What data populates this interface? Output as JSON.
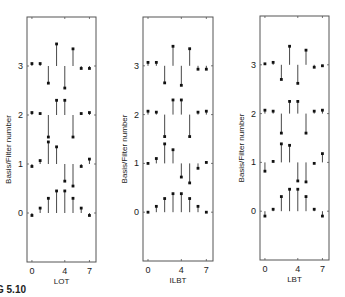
{
  "figure": {
    "caption": "G 5.10"
  },
  "chart_data": [
    {
      "type": "stem",
      "title": "",
      "xlabel": "LOT",
      "ylabel": "Basis/Filter number",
      "xticks": [
        0,
        4,
        7
      ],
      "yticks": [
        0,
        1,
        2,
        3
      ],
      "xlim": [
        -0.6,
        7.8
      ],
      "ylim": [
        -1,
        4
      ],
      "grid": false,
      "x": [
        0,
        1,
        2,
        3,
        4,
        5,
        6,
        7
      ],
      "series": [
        {
          "name": "basis 0",
          "offset": 0,
          "values": [
            -0.05,
            0.1,
            0.3,
            0.45,
            0.45,
            0.3,
            0.1,
            -0.05
          ]
        },
        {
          "name": "basis 1",
          "offset": 1,
          "values": [
            -0.05,
            0.07,
            0.45,
            0.35,
            -0.35,
            -0.45,
            -0.05,
            0.1
          ]
        },
        {
          "name": "basis 2",
          "offset": 2,
          "values": [
            0.05,
            0.03,
            -0.45,
            0.3,
            0.3,
            -0.45,
            0.03,
            0.05
          ]
        },
        {
          "name": "basis 3",
          "offset": 3,
          "values": [
            0.05,
            0.05,
            -0.35,
            0.45,
            -0.45,
            0.35,
            -0.05,
            -0.05
          ]
        }
      ]
    },
    {
      "type": "stem",
      "title": "",
      "xlabel": "ILBT",
      "ylabel": "Basis/Filter number",
      "xticks": [
        0,
        4,
        7
      ],
      "yticks": [
        0,
        1,
        2,
        3
      ],
      "xlim": [
        -0.6,
        7.8
      ],
      "ylim": [
        -1,
        4
      ],
      "grid": false,
      "x": [
        0,
        1,
        2,
        3,
        4,
        5,
        6,
        7
      ],
      "series": [
        {
          "name": "basis 0",
          "offset": 0,
          "values": [
            0.0,
            0.12,
            0.28,
            0.38,
            0.38,
            0.28,
            0.12,
            0.0
          ]
        },
        {
          "name": "basis 1",
          "offset": 1,
          "values": [
            0.0,
            0.1,
            0.4,
            0.28,
            -0.28,
            -0.4,
            -0.1,
            0.02
          ]
        },
        {
          "name": "basis 2",
          "offset": 2,
          "values": [
            0.07,
            0.05,
            -0.45,
            0.3,
            0.3,
            -0.45,
            0.05,
            0.07
          ]
        },
        {
          "name": "basis 3",
          "offset": 3,
          "values": [
            0.07,
            0.07,
            -0.35,
            0.4,
            -0.4,
            0.35,
            -0.07,
            -0.07
          ]
        }
      ]
    },
    {
      "type": "stem",
      "title": "",
      "xlabel": "LBT",
      "ylabel": "Basis/Filter number",
      "xticks": [
        0,
        4,
        7
      ],
      "yticks": [
        0,
        1,
        2,
        3
      ],
      "xlim": [
        -0.6,
        7.8
      ],
      "ylim": [
        -1,
        4
      ],
      "grid": false,
      "x": [
        0,
        1,
        2,
        3,
        4,
        5,
        6,
        7
      ],
      "series": [
        {
          "name": "basis 0",
          "offset": 0,
          "values": [
            -0.1,
            0.04,
            0.3,
            0.45,
            0.45,
            0.3,
            0.04,
            -0.1
          ]
        },
        {
          "name": "basis 1",
          "offset": 1,
          "values": [
            -0.18,
            0.02,
            0.38,
            0.35,
            -0.38,
            -0.4,
            -0.02,
            0.18
          ]
        },
        {
          "name": "basis 2",
          "offset": 2,
          "values": [
            0.07,
            0.05,
            -0.4,
            0.25,
            0.25,
            -0.4,
            0.05,
            0.07
          ]
        },
        {
          "name": "basis 3",
          "offset": 3,
          "values": [
            0.02,
            0.05,
            -0.3,
            0.38,
            -0.38,
            0.3,
            -0.05,
            -0.02
          ]
        }
      ]
    }
  ],
  "panels": [
    {
      "xlabel": "LOT",
      "ylabel": "Basis/Filter number",
      "xtick_labels": [
        "0",
        "4",
        "7"
      ],
      "ytick_labels": [
        "0",
        "1",
        "2",
        "3"
      ]
    },
    {
      "xlabel": "ILBT",
      "ylabel": "Basis/Filter number",
      "xtick_labels": [
        "0",
        "4",
        "7"
      ],
      "ytick_labels": [
        "0",
        "1",
        "2",
        "3"
      ]
    },
    {
      "xlabel": "LBT",
      "ylabel": "Basis/Filter number",
      "xtick_labels": [
        "0",
        "4",
        "7"
      ],
      "ytick_labels": [
        "0",
        "1",
        "2",
        "3"
      ]
    }
  ],
  "colors": {
    "axis": "#555555",
    "stem": "#333333",
    "marker": "#111111"
  }
}
